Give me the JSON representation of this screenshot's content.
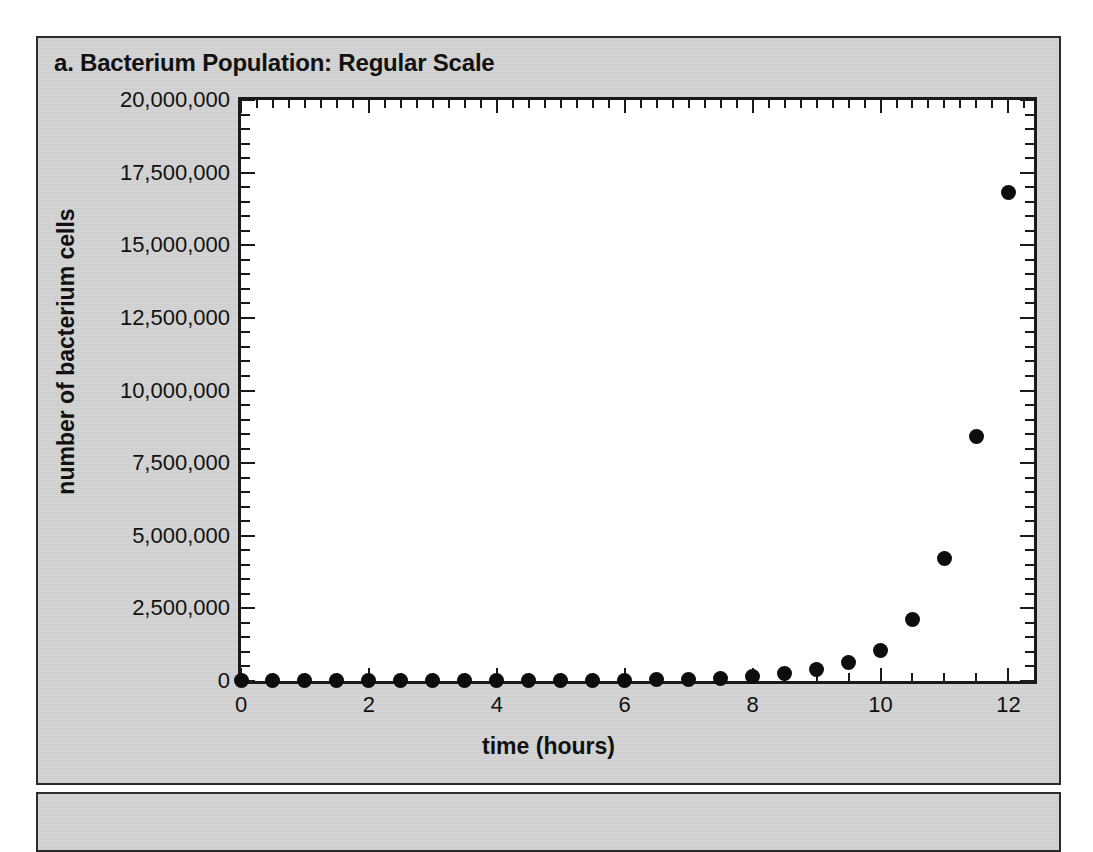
{
  "figure": {
    "background_color": "#ffffff",
    "panel_color": "#d4d4d4",
    "panel_border_color": "#2b2b2b",
    "marker_color": "#0d0d0d",
    "axis_color": "#1a1a1a"
  },
  "panel_a": {
    "title": "a. Bacterium Population: Regular Scale"
  },
  "chart_data": {
    "type": "scatter",
    "title": "a. Bacterium Population: Regular Scale",
    "xlabel": "time (hours)",
    "ylabel": "number of bacterium cells",
    "xlim": [
      0,
      12.4
    ],
    "ylim": [
      0,
      20000000
    ],
    "grid": false,
    "legend": false,
    "x_ticks": [
      0,
      2,
      4,
      6,
      8,
      10,
      12
    ],
    "x_tick_labels": [
      "0",
      "2",
      "4",
      "6",
      "8",
      "10",
      "12"
    ],
    "x_minor_step": 0.5,
    "y_ticks": [
      0,
      2500000,
      5000000,
      7500000,
      10000000,
      12500000,
      15000000,
      17500000,
      20000000
    ],
    "y_tick_labels": [
      "0",
      "2,500,000",
      "5,000,000",
      "7,500,000",
      "10,000,000",
      "12,500,000",
      "15,000,000",
      "17,500,000",
      "20,000,000"
    ],
    "y_minor_count": 5,
    "x": [
      0,
      0.5,
      1,
      1.5,
      2,
      2.5,
      3,
      3.5,
      4,
      4.5,
      5,
      5.5,
      6,
      6.5,
      7,
      7.5,
      8,
      8.5,
      9,
      9.5,
      10,
      10.5,
      11,
      11.5,
      12
    ],
    "y": [
      100,
      160,
      250,
      400,
      630,
      1000,
      1600,
      2500,
      4000,
      6300,
      10000,
      16000,
      25000,
      40000,
      63000,
      100000,
      160000,
      250000,
      400000,
      630000,
      1050000,
      2100000,
      4200000,
      8400000,
      16800000
    ],
    "series": [
      {
        "name": "number of bacterium cells",
        "marker": "filled-circle",
        "color": "#0d0d0d"
      }
    ]
  }
}
